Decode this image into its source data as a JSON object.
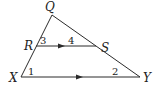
{
  "diagram": {
    "type": "triangle-with-parallel-segment",
    "vertices": {
      "Q": {
        "label": "Q",
        "x": 52,
        "y": 15
      },
      "X": {
        "label": "X",
        "x": 21,
        "y": 77
      },
      "Y": {
        "label": "Y",
        "x": 140,
        "y": 77
      },
      "R": {
        "label": "R",
        "x": 36,
        "y": 46
      },
      "S": {
        "label": "S",
        "x": 96,
        "y": 46
      }
    },
    "segments": [
      {
        "from": "Q",
        "to": "X"
      },
      {
        "from": "Q",
        "to": "Y"
      },
      {
        "from": "X",
        "to": "Y",
        "parallel_mark": true
      },
      {
        "from": "R",
        "to": "S",
        "parallel_mark": true
      }
    ],
    "angles": [
      {
        "label": "1",
        "at": "X"
      },
      {
        "label": "2",
        "at": "Y"
      },
      {
        "label": "3",
        "at": "R"
      },
      {
        "label": "4",
        "at": "S"
      }
    ],
    "relation": "RS ∥ XY"
  }
}
